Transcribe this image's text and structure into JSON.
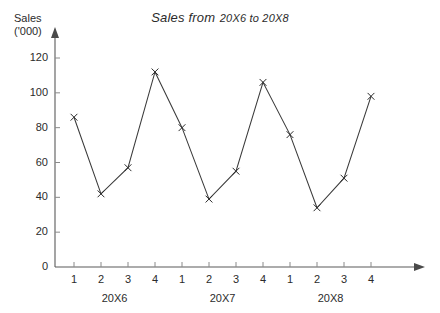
{
  "chart_data": {
    "type": "line",
    "title": "Sales from 20X6 to 20X8",
    "title_main": "Sales from",
    "title_range": "20X6 to 20X8",
    "xlabel": "",
    "ylabel": "Sales ('000)",
    "ylabel_line1": "Sales",
    "ylabel_line2": "('000)",
    "ylim": [
      0,
      120
    ],
    "ytick_labels": [
      "0",
      "20",
      "40",
      "60",
      "80",
      "100",
      "120"
    ],
    "ytick_values": [
      0,
      20,
      40,
      60,
      80,
      100,
      120
    ],
    "grid": false,
    "legend": "none",
    "marker": "x",
    "line_color": "#3a3a3a",
    "marker_color": "#2b2b2b",
    "axis_color": "#5a5a5a",
    "categories": [
      "1",
      "2",
      "3",
      "4",
      "1",
      "2",
      "3",
      "4",
      "1",
      "2",
      "3",
      "4"
    ],
    "values": [
      86,
      42,
      57,
      112,
      80,
      39,
      55,
      106,
      76,
      34,
      51,
      98
    ],
    "groups": [
      {
        "label": "20X6",
        "quarters": [
          "1",
          "2",
          "3",
          "4"
        ],
        "values": [
          86,
          42,
          57,
          112
        ]
      },
      {
        "label": "20X7",
        "quarters": [
          "1",
          "2",
          "3",
          "4"
        ],
        "values": [
          80,
          39,
          55,
          106
        ]
      },
      {
        "label": "20X8",
        "quarters": [
          "1",
          "2",
          "3",
          "4"
        ],
        "values": [
          76,
          34,
          51,
          98
        ]
      }
    ]
  }
}
